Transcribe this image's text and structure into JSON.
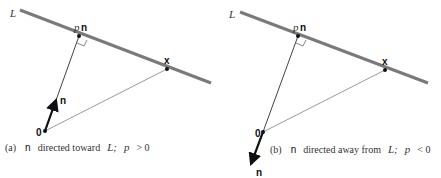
{
  "panels": [
    {
      "id": "a",
      "line_label": "L",
      "foot_label_p": "p",
      "foot_label_n": "n",
      "point_x_label": "x",
      "origin_label": "0",
      "normal_label": "n",
      "caption_prefix": "(a)",
      "caption_n": "n",
      "caption_text": "directed toward",
      "caption_L": "L;",
      "caption_p": "p",
      "caption_rel": "> 0"
    },
    {
      "id": "b",
      "line_label": "L",
      "foot_label_p": "p",
      "foot_label_n": "n",
      "point_x_label": "x",
      "origin_label": "0",
      "normal_label": "n",
      "caption_prefix": "(b)",
      "caption_n": "n",
      "caption_text": "directed away from",
      "caption_L": "L;",
      "caption_p": "p",
      "caption_rel": "< 0"
    }
  ],
  "colors": {
    "line_L": "#7a7a7a",
    "ink": "#111111"
  }
}
